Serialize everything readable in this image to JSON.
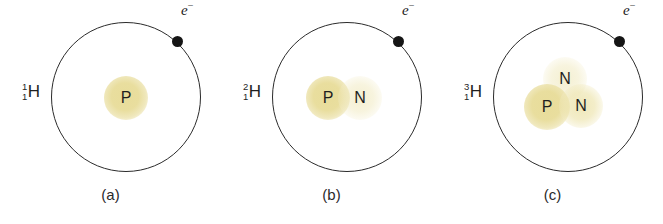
{
  "figure": {
    "background_color": "#ffffff",
    "orbit_color": "#2b2b2b",
    "electron_color": "#151515",
    "nucleus_color": "#e7db96"
  },
  "panels": [
    {
      "id": "a",
      "caption": "(a)",
      "isotope": {
        "mass_number": "1",
        "atomic_number": "1",
        "symbol": "H"
      },
      "electron": {
        "label_base": "e",
        "label_charge": "−"
      },
      "nucleons": [
        {
          "label": "P",
          "kind": "proton",
          "intensity": "strong"
        }
      ]
    },
    {
      "id": "b",
      "caption": "(b)",
      "isotope": {
        "mass_number": "2",
        "atomic_number": "1",
        "symbol": "H"
      },
      "electron": {
        "label_base": "e",
        "label_charge": "−"
      },
      "nucleons": [
        {
          "label": "P",
          "kind": "proton",
          "intensity": "strong"
        },
        {
          "label": "N",
          "kind": "neutron",
          "intensity": "faint"
        }
      ]
    },
    {
      "id": "c",
      "caption": "(c)",
      "isotope": {
        "mass_number": "3",
        "atomic_number": "1",
        "symbol": "H"
      },
      "electron": {
        "label_base": "e",
        "label_charge": "−"
      },
      "nucleons": [
        {
          "label": "N",
          "kind": "neutron",
          "intensity": "faint"
        },
        {
          "label": "P",
          "kind": "proton",
          "intensity": "strong"
        },
        {
          "label": "N",
          "kind": "neutron",
          "intensity": "mid"
        }
      ]
    }
  ]
}
